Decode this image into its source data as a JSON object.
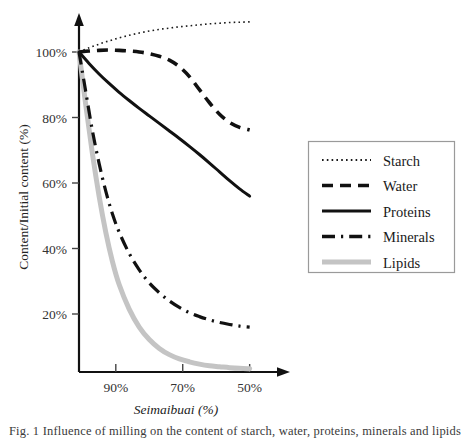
{
  "figure": {
    "background": "#ffffff",
    "caption_partial": "Fig. 1  Influence of milling on the content of starch, water, proteins, minerals and lipids"
  },
  "chart_data": {
    "type": "line",
    "title": "",
    "xlabel": "Seimaibuai (%)",
    "ylabel": "Content/Initial content (%)",
    "xlabel_italic": true,
    "x_tick_labels": [
      "90%",
      "70%",
      "50%"
    ],
    "x_ticks": [
      90,
      70,
      50
    ],
    "xlim": [
      101,
      49
    ],
    "x_axis_reversed": true,
    "y_tick_labels": [
      "20%",
      "40%",
      "60%",
      "80%",
      "100%"
    ],
    "y_ticks": [
      20,
      40,
      60,
      80,
      100
    ],
    "ylim": [
      0,
      112
    ],
    "grid": false,
    "legend_position": "right-outside",
    "series": [
      {
        "name": "Starch",
        "style": "dotted",
        "color": "#1a1a1a",
        "width": 1.6,
        "x": [
          101,
          98,
          95,
          92,
          89,
          86,
          83,
          80,
          77,
          74,
          71,
          68,
          65,
          62,
          59,
          56,
          53,
          50
        ],
        "values": [
          100,
          101.3,
          102.4,
          103.4,
          104.3,
          105.1,
          105.8,
          106.4,
          106.9,
          107.3,
          107.7,
          108.0,
          108.3,
          108.6,
          108.8,
          109.0,
          109.1,
          109.2
        ]
      },
      {
        "name": "Water",
        "style": "dashed",
        "color": "#111111",
        "width": 3.6,
        "x": [
          101,
          98,
          95,
          92,
          89,
          86,
          83,
          80,
          77,
          74,
          71,
          68,
          65,
          62,
          59,
          56,
          53,
          50
        ],
        "values": [
          100,
          100.3,
          100.5,
          100.6,
          100.5,
          100.3,
          100.0,
          99.5,
          98.7,
          97.5,
          95.5,
          92.5,
          88.5,
          84.5,
          81.0,
          78.5,
          77.0,
          76.2
        ]
      },
      {
        "name": "Proteins",
        "style": "solid",
        "color": "#111111",
        "width": 3.0,
        "x": [
          101,
          98,
          95,
          92,
          89,
          86,
          83,
          80,
          77,
          74,
          71,
          68,
          65,
          62,
          59,
          56,
          53,
          50
        ],
        "values": [
          100,
          96.5,
          93.3,
          90.4,
          87.7,
          85.2,
          82.8,
          80.5,
          78.2,
          75.9,
          73.6,
          71.2,
          68.7,
          66.1,
          63.4,
          60.7,
          58.2,
          56.0
        ]
      },
      {
        "name": "Minerals",
        "style": "dashdot",
        "color": "#111111",
        "width": 3.2,
        "x": [
          101,
          99,
          97,
          95,
          93,
          91,
          89,
          86,
          83,
          80,
          77,
          74,
          71,
          68,
          65,
          62,
          59,
          56,
          53,
          50
        ],
        "values": [
          100,
          88,
          76,
          66,
          57.5,
          50.5,
          45.0,
          38.5,
          33.5,
          29.5,
          26.5,
          24.0,
          22.0,
          20.4,
          19.2,
          18.2,
          17.4,
          16.8,
          16.3,
          16.0
        ]
      },
      {
        "name": "Lipids",
        "style": "solid",
        "color": "#c4c4c4",
        "width": 5.0,
        "x": [
          101,
          99,
          97,
          95,
          93,
          91,
          89,
          86,
          83,
          80,
          77,
          74,
          71,
          68,
          65,
          62,
          59,
          56,
          53,
          50
        ],
        "values": [
          100,
          84,
          69,
          56,
          45,
          36,
          29,
          21.5,
          16.0,
          12.2,
          9.5,
          7.6,
          6.3,
          5.4,
          4.7,
          4.2,
          3.9,
          3.6,
          3.4,
          3.3
        ]
      }
    ]
  },
  "legend": {
    "items": [
      {
        "label": "Starch",
        "style": "dotted"
      },
      {
        "label": "Water",
        "style": "dashed"
      },
      {
        "label": "Proteins",
        "style": "solid"
      },
      {
        "label": "Minerals",
        "style": "dashdot"
      },
      {
        "label": "Lipids",
        "style": "solid-gray"
      }
    ]
  }
}
